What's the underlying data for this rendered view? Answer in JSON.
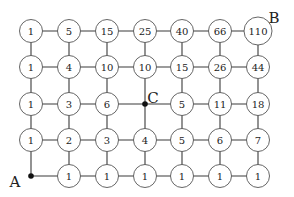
{
  "diagram": {
    "columns_x": [
      31,
      69,
      107,
      145,
      182,
      220,
      258
    ],
    "rows_y": [
      31,
      67,
      104,
      140,
      176
    ],
    "node_radius": 11.5,
    "grid_values": [
      [
        "1",
        "5",
        "15",
        "25",
        "40",
        "66",
        "110"
      ],
      [
        "1",
        "4",
        "10",
        "10",
        "15",
        "26",
        "44"
      ],
      [
        "1",
        "3",
        "6",
        null,
        "5",
        "11",
        "18"
      ],
      [
        "1",
        "2",
        "3",
        "4",
        "5",
        "6",
        "7"
      ],
      [
        null,
        "1",
        "1",
        "1",
        "1",
        "1",
        "1"
      ]
    ],
    "points": [
      {
        "label": "A",
        "row": 4,
        "col": 0,
        "label_dx": -16,
        "label_dy": 6
      },
      {
        "label": "C",
        "row": 2,
        "col": 3,
        "label_dx": 8,
        "label_dy": -6
      },
      {
        "label": "B",
        "row": 0,
        "col": 6,
        "label_dx": 16,
        "label_dy": -13,
        "no_dot": true
      }
    ],
    "colors": {
      "edge": "#3a3a3a",
      "node_stroke": "#555555",
      "dot": "#111111"
    }
  }
}
